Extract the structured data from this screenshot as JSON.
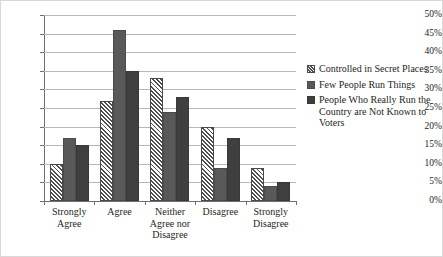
{
  "figure": {
    "border_color": "#d8d8d8",
    "background": "#ffffff"
  },
  "chart_data": {
    "type": "bar",
    "title": "",
    "subtitle": "",
    "xlabel": "",
    "ylabel": "",
    "ylim": [
      0,
      50
    ],
    "y_tick_labels": [
      "0%",
      "5%",
      "10%",
      "15%",
      "20%",
      "25%",
      "30%",
      "35%",
      "40%",
      "45%",
      "50%"
    ],
    "y_tick_values": [
      0,
      5,
      10,
      15,
      20,
      25,
      30,
      35,
      40,
      45,
      50
    ],
    "grid": "horizontal",
    "legend_position": "right",
    "categories": [
      "Strongly Agree",
      "Agree",
      "Neither Agree nor Disagree",
      "Disagree",
      "Strongly Disagree"
    ],
    "category_label_lines": [
      [
        "Strongly",
        "Agree"
      ],
      [
        "Agree"
      ],
      [
        "Neither",
        "Agree nor",
        "Disagree"
      ],
      [
        "Disagree"
      ],
      [
        "Strongly",
        "Disagree"
      ]
    ],
    "series": [
      {
        "name": "Controlled in Secret Places",
        "fill": "diagonal-hatch",
        "color": "#ffffff",
        "values": [
          10,
          27,
          33,
          20,
          9
        ]
      },
      {
        "name": "Few People Run Things",
        "fill": "solid",
        "color": "#595959",
        "values": [
          17,
          46,
          24,
          9,
          4
        ]
      },
      {
        "name": "People Who Really Run the Country are Not Known to Voters",
        "fill": "solid",
        "color": "#3f3f3f",
        "values": [
          15,
          35,
          28,
          17,
          5
        ]
      }
    ]
  },
  "legend": {
    "entries": [
      {
        "label": "Controlled in Secret Places"
      },
      {
        "label": "Few People Run Things"
      },
      {
        "label": "People Who Really Run the Country are Not Known to Voters"
      }
    ]
  }
}
